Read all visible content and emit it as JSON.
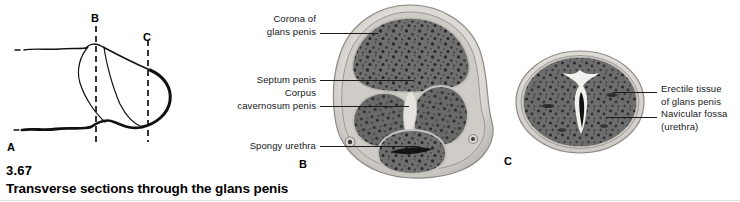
{
  "figure": {
    "number": "3.67",
    "title": "Transverse sections through the glans penis",
    "panels": [
      {
        "letter": "A",
        "kind": "line-diagram"
      },
      {
        "letter": "B",
        "kind": "histology-section"
      },
      {
        "letter": "C",
        "kind": "histology-section"
      }
    ]
  },
  "panel_a": {
    "letter": "A",
    "section_marks": [
      {
        "label": "B"
      },
      {
        "label": "C"
      }
    ]
  },
  "panel_b": {
    "letter": "B",
    "labels": [
      {
        "line1": "Corona of",
        "line2": "glans penis"
      },
      {
        "line1": "Septum penis",
        "line2": ""
      },
      {
        "line1": "Corpus",
        "line2": "cavernosum penis"
      },
      {
        "line1": "Spongy urethra",
        "line2": ""
      }
    ]
  },
  "panel_c": {
    "letter": "C",
    "labels": [
      {
        "line1": "Erectile tissue",
        "line2": "of glans penis"
      },
      {
        "line1": "Navicular fossa",
        "line2": "(urethra)"
      }
    ]
  },
  "colors": {
    "page_background": "#ffffff",
    "text": "#15171a",
    "caption_text": "#000000",
    "leader_line": "#1b1b1b",
    "tissue_mid_gray": "#707070",
    "tissue_dark": "#333333",
    "tissue_light": "#d8d6d2",
    "capsule_pale": "#e8e6e2"
  }
}
